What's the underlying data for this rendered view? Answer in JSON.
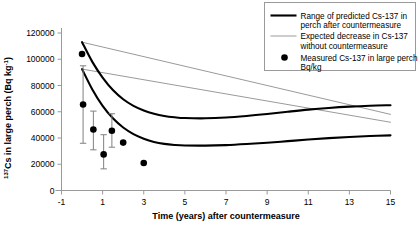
{
  "chart_data": {
    "type": "line",
    "title": "",
    "xlabel": "Time (years) after countermeasure",
    "ylabel_parts": {
      "superscript": "137",
      "main": "Cs in large perch (Bq kg",
      "exponent": "-1",
      "close": ")"
    },
    "ylabel": "137Cs in large perch (Bq kg-1)",
    "xlim": [
      -1,
      15
    ],
    "ylim": [
      0,
      120000
    ],
    "xticks": [
      -1,
      1,
      3,
      5,
      7,
      9,
      11,
      13,
      15
    ],
    "xtick_labels": [
      "-1",
      "1",
      "3",
      "5",
      "7",
      "9",
      "11",
      "13",
      "15"
    ],
    "yticks": [
      0,
      20000,
      40000,
      60000,
      80000,
      100000,
      120000
    ],
    "ytick_labels": [
      "0",
      "20000",
      "40000",
      "60000",
      "80000",
      "100000",
      "120000"
    ],
    "grid": false,
    "legend_position": "top-right",
    "series": [
      {
        "name": "Range of predicted Cs-137 in perch after countermeasure (upper bound)",
        "style": "thick-black",
        "color": "#000000",
        "x": [
          0,
          0.5,
          1,
          1.5,
          2,
          2.5,
          3,
          3.5,
          4,
          4.5,
          5,
          6,
          7,
          8,
          9,
          10,
          11,
          12,
          13,
          14,
          15
        ],
        "y": [
          113000,
          98000,
          86000,
          76500,
          69500,
          64500,
          61000,
          58500,
          56800,
          55800,
          55200,
          55000,
          55600,
          56800,
          58300,
          60000,
          61600,
          62900,
          63900,
          64600,
          65000
        ]
      },
      {
        "name": "Range of predicted Cs-137 in perch after countermeasure (lower bound)",
        "style": "thick-black",
        "color": "#000000",
        "x": [
          0,
          0.5,
          1,
          1.5,
          2,
          2.5,
          3,
          3.5,
          4,
          4.5,
          5,
          6,
          7,
          8,
          9,
          10,
          11,
          12,
          13,
          14,
          15
        ],
        "y": [
          92500,
          77000,
          64500,
          55000,
          48000,
          43000,
          39500,
          37000,
          35500,
          34700,
          34300,
          34200,
          34600,
          35400,
          36400,
          37600,
          38800,
          39900,
          40800,
          41500,
          42000
        ]
      },
      {
        "name": "Expected decrease in Cs-137 without countermeasure (upper)",
        "style": "thin-grey",
        "color": "#808080",
        "x": [
          0,
          15
        ],
        "y": [
          113000,
          58000
        ]
      },
      {
        "name": "Expected decrease in Cs-137 without countermeasure (lower)",
        "style": "thin-grey",
        "color": "#808080",
        "x": [
          0,
          15
        ],
        "y": [
          92500,
          52000
        ]
      }
    ],
    "points": [
      {
        "x": 0.0,
        "y": 104000,
        "yerr_low": null,
        "yerr_high": null
      },
      {
        "x": 0.05,
        "y": 65500,
        "yerr_low": 36000,
        "yerr_high": 95000
      },
      {
        "x": 0.55,
        "y": 46500,
        "yerr_low": 31000,
        "yerr_high": 60500
      },
      {
        "x": 1.05,
        "y": 27500,
        "yerr_low": 16500,
        "yerr_high": 42500
      },
      {
        "x": 1.45,
        "y": 45500,
        "yerr_low": 33000,
        "yerr_high": 58500
      },
      {
        "x": 2.0,
        "y": 36500,
        "yerr_low": null,
        "yerr_high": null
      },
      {
        "x": 3.0,
        "y": 21000,
        "yerr_low": null,
        "yerr_high": null
      }
    ],
    "point_marker": "filled-circle",
    "point_color": "#000000",
    "errorbar_color": "#808080"
  },
  "legend": {
    "items": [
      {
        "marker": "thick-line",
        "line1": "Range of predicted Cs-137 in",
        "line2": "perch after countermeasure"
      },
      {
        "marker": "thin-line",
        "line1": "Expected decrease in Cs-137",
        "line2": "without countermeasure"
      },
      {
        "marker": "dot",
        "line1": "Measured Cs-137 in large perch",
        "line2": "Bq/kg"
      }
    ]
  },
  "axis": {
    "x_title": "Time (years) after countermeasure",
    "y_sup": "137",
    "y_main": "Cs in large perch (Bq kg",
    "y_exp": "-1",
    "y_close": ")"
  },
  "colors": {
    "background": "#ffffff",
    "axis": "#9a9a9a",
    "series_dark": "#000000",
    "series_light": "#808080",
    "legend_border": "#9a9a9a"
  }
}
